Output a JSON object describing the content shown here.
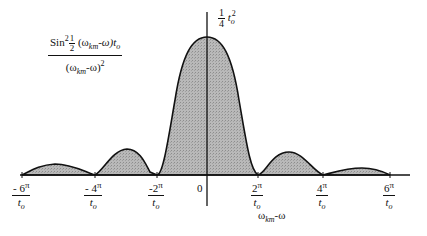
{
  "diagram": {
    "title_formula": {
      "numerator_prefix": "Sin",
      "numerator_power": "2",
      "half_num": "1",
      "half_den": "2",
      "numerator_arg_open": "(ω",
      "numerator_sub": "km",
      "numerator_arg_close": "-ω)t",
      "numerator_t_sub": "o",
      "denominator_open": "(ω",
      "denominator_sub": "km",
      "denominator_close": "-ω)",
      "denominator_power": "2"
    },
    "peak_label": {
      "frac_num": "1",
      "frac_den": "4",
      "t": "t",
      "t_sub": "o",
      "power": "2"
    },
    "x_axis_label": {
      "omega": "ω",
      "sub": "km",
      "rest": "-ω"
    },
    "ticks": [
      {
        "sign": "-",
        "coef": "6",
        "pi": "π",
        "den": "t",
        "den_sub": "o"
      },
      {
        "sign": "-",
        "coef": "4",
        "pi": "π",
        "den": "t",
        "den_sub": "o"
      },
      {
        "sign": "-",
        "coef": "2",
        "pi": "π",
        "den": "t",
        "den_sub": "o"
      },
      {
        "sign": "",
        "coef": "2",
        "pi": "π",
        "den": "t",
        "den_sub": "o"
      },
      {
        "sign": "",
        "coef": "4",
        "pi": "π",
        "den": "t",
        "den_sub": "o"
      },
      {
        "sign": "",
        "coef": "6",
        "pi": "π",
        "den": "t",
        "den_sub": "o"
      }
    ],
    "origin_label": "0",
    "fill_color": "#b5b5b5",
    "line_color": "#111111"
  }
}
